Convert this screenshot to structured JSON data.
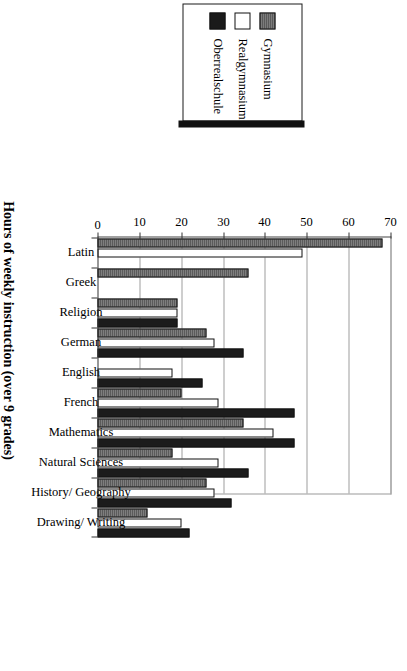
{
  "chart_data": {
    "type": "bar",
    "title": "",
    "xlabel": "",
    "ylabel": "Hours of weekly instruction (over 9 grades)",
    "ylim": [
      0,
      70
    ],
    "yticks": [
      0,
      10,
      20,
      30,
      40,
      50,
      60,
      70
    ],
    "grid": true,
    "orientation": "vertical-rotated-90",
    "legend_position": "top-left",
    "categories": [
      "Latin",
      "Greek",
      "Religion",
      "German",
      "English",
      "French",
      "Mathematics",
      "Natural Sciences",
      "History/ Geography",
      "Drawing/ Writing"
    ],
    "series": [
      {
        "name": "Gymnasium",
        "color": "#6e6e6e",
        "values": [
          68,
          36,
          19,
          26,
          0,
          20,
          35,
          18,
          26,
          12
        ]
      },
      {
        "name": "Realgymnasium",
        "color": "#ffffff",
        "values": [
          49,
          0,
          19,
          28,
          18,
          29,
          42,
          29,
          28,
          20
        ]
      },
      {
        "name": "Oberrealschule",
        "color": "#1c1c1c",
        "values": [
          0,
          0,
          19,
          35,
          25,
          47,
          47,
          36,
          32,
          22
        ]
      }
    ]
  },
  "legend": {
    "items": [
      {
        "label": "Gymnasium",
        "swatch": "hatched-gray-swatch"
      },
      {
        "label": "Realgymnasium",
        "swatch": "white-swatch"
      },
      {
        "label": "Oberrealschule",
        "swatch": "black-swatch"
      }
    ]
  },
  "axis": {
    "value_axis_title": "Hours of weekly instruction (over 9 grades)",
    "tick_labels": [
      "0",
      "10",
      "20",
      "30",
      "40",
      "50",
      "60",
      "70"
    ]
  }
}
